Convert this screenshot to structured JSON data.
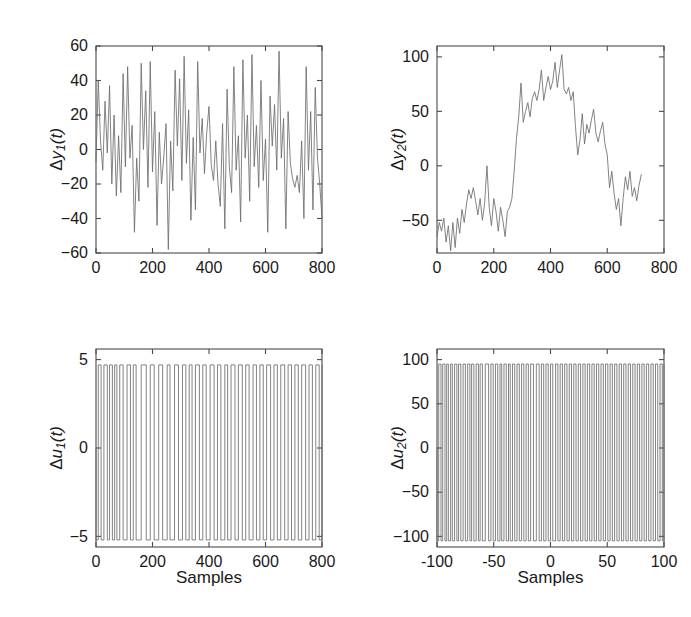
{
  "figure": {
    "background": "#ffffff",
    "trace_color": "#6d6d6d",
    "axis_color": "#4a4a4a",
    "xlabel": "Samples"
  },
  "chart_data": [
    {
      "id": "dy1",
      "type": "line",
      "title": "",
      "xlabel": "",
      "ylabel": "Δy_1(t)",
      "ylabel_parts": {
        "delta": "Δ",
        "var": "y",
        "sub": "1",
        "suffix": "(t)"
      },
      "xlim": [
        0,
        800
      ],
      "ylim": [
        -60,
        60
      ],
      "xticks": [
        0,
        200,
        400,
        600,
        800
      ],
      "yticks": [
        -60,
        -40,
        -20,
        0,
        20,
        40,
        60
      ],
      "xticklabels": [
        "0",
        "200",
        "400",
        "600",
        "800"
      ],
      "yticklabels": [
        "-60",
        "-40",
        "-20",
        "0",
        "20",
        "40",
        "60"
      ],
      "grid": false,
      "legend": null,
      "x": [
        0,
        8,
        16,
        24,
        32,
        40,
        48,
        56,
        64,
        72,
        80,
        88,
        96,
        104,
        112,
        120,
        128,
        136,
        144,
        152,
        160,
        168,
        176,
        184,
        192,
        200,
        208,
        216,
        224,
        232,
        240,
        248,
        256,
        264,
        272,
        280,
        288,
        296,
        304,
        312,
        320,
        328,
        336,
        344,
        352,
        360,
        368,
        376,
        384,
        392,
        400,
        408,
        416,
        424,
        432,
        440,
        448,
        456,
        464,
        472,
        480,
        488,
        496,
        504,
        512,
        520,
        528,
        536,
        544,
        552,
        560,
        568,
        576,
        584,
        592,
        600,
        608,
        616,
        624,
        632,
        640,
        648,
        656,
        664,
        672,
        680,
        688,
        696,
        704,
        712,
        720,
        728,
        736,
        744,
        752,
        760,
        768,
        776,
        784,
        792,
        800
      ],
      "values": [
        -7,
        40,
        5,
        -12,
        28,
        -2,
        37,
        -20,
        20,
        -27,
        8,
        -25,
        44,
        -10,
        48,
        -5,
        14,
        -48,
        -5,
        -30,
        50,
        0,
        34,
        -22,
        51,
        -13,
        22,
        -44,
        10,
        -20,
        -4,
        15,
        -58,
        5,
        -24,
        46,
        2,
        41,
        -18,
        54,
        -8,
        23,
        -41,
        7,
        -35,
        51,
        -2,
        18,
        -14,
        10,
        25,
        -9,
        -18,
        5,
        -20,
        -33,
        15,
        -46,
        35,
        -10,
        -25,
        48,
        -12,
        8,
        -42,
        52,
        -5,
        20,
        -30,
        55,
        -10,
        14,
        -22,
        40,
        -18,
        6,
        -48,
        31,
        2,
        26,
        -12,
        57,
        -5,
        18,
        -46,
        22,
        -8,
        -17,
        -22,
        -15,
        -25,
        5,
        -40,
        48,
        -12,
        22,
        -35,
        36,
        -5,
        -20,
        -40,
        -15
      ]
    },
    {
      "id": "dy2",
      "type": "line",
      "title": "",
      "xlabel": "",
      "ylabel": "Δy_2(t)",
      "ylabel_parts": {
        "delta": "Δ",
        "var": "y",
        "sub": "2",
        "suffix": "(t)"
      },
      "xlim": [
        0,
        800
      ],
      "ylim": [
        -80,
        110
      ],
      "xticks": [
        0,
        200,
        400,
        600,
        800
      ],
      "yticks": [
        -50,
        0,
        50,
        100
      ],
      "xticklabels": [
        "0",
        "200",
        "400",
        "600",
        "800"
      ],
      "yticklabels": [
        "-50",
        "0",
        "50",
        "100"
      ],
      "grid": false,
      "legend": null,
      "x": [
        0,
        8,
        16,
        24,
        32,
        40,
        48,
        56,
        64,
        72,
        80,
        88,
        96,
        104,
        112,
        120,
        128,
        136,
        144,
        152,
        160,
        168,
        176,
        184,
        192,
        200,
        208,
        216,
        224,
        232,
        240,
        248,
        256,
        264,
        272,
        280,
        288,
        296,
        304,
        312,
        320,
        328,
        336,
        344,
        352,
        360,
        368,
        376,
        384,
        392,
        400,
        408,
        416,
        424,
        432,
        440,
        448,
        456,
        464,
        472,
        480,
        488,
        496,
        504,
        512,
        520,
        528,
        536,
        544,
        552,
        560,
        568,
        576,
        584,
        592,
        600,
        608,
        616,
        624,
        632,
        640,
        648,
        656,
        664,
        672,
        680,
        688,
        696,
        704,
        712,
        720,
        728,
        736,
        744,
        752,
        760,
        768,
        776,
        784,
        792,
        800
      ],
      "values": [
        -65,
        -52,
        -60,
        -48,
        -70,
        -55,
        -78,
        -52,
        -75,
        -48,
        -62,
        -40,
        -52,
        -35,
        -22,
        -30,
        -20,
        -32,
        -45,
        -30,
        -50,
        -34,
        0,
        -38,
        -55,
        -30,
        -42,
        -60,
        -38,
        -50,
        -65,
        -42,
        -38,
        -30,
        -5,
        25,
        45,
        76,
        40,
        50,
        58,
        45,
        62,
        68,
        60,
        70,
        88,
        60,
        72,
        82,
        70,
        78,
        95,
        72,
        88,
        102,
        70,
        66,
        72,
        60,
        68,
        36,
        10,
        24,
        48,
        20,
        38,
        30,
        42,
        52,
        30,
        22,
        32,
        40,
        20,
        10,
        -20,
        -5,
        -25,
        -40,
        -30,
        -55,
        -30,
        -10,
        -22,
        -5,
        -28,
        -20,
        -32,
        -18,
        -8
      ]
    },
    {
      "id": "du1",
      "type": "line",
      "title": "",
      "xlabel": "Samples",
      "ylabel": "Δu_1(t)",
      "ylabel_parts": {
        "delta": "Δ",
        "var": "u",
        "sub": "1",
        "suffix": "(t)"
      },
      "xlim": [
        0,
        800
      ],
      "ylim": [
        -5.6,
        5.6
      ],
      "xticks": [
        0,
        200,
        400,
        600,
        800
      ],
      "yticks": [
        -5,
        0,
        5
      ],
      "xticklabels": [
        "0",
        "200",
        "400",
        "600",
        "800"
      ],
      "yticklabels": [
        "-5",
        "0",
        "5"
      ],
      "grid": false,
      "legend": null,
      "signal_type": "prbs",
      "levels": [
        -5.2,
        4.7
      ],
      "edges": [
        0,
        8,
        18,
        28,
        40,
        48,
        58,
        66,
        74,
        84,
        96,
        110,
        122,
        132,
        142,
        160,
        178,
        192,
        206,
        222,
        236,
        252,
        262,
        278,
        292,
        306,
        318,
        330,
        340,
        352,
        366,
        378,
        390,
        404,
        418,
        430,
        442,
        456,
        466,
        478,
        492,
        504,
        518,
        530,
        542,
        556,
        568,
        580,
        592,
        604,
        618,
        630,
        642,
        654,
        668,
        680,
        692,
        704,
        716,
        728,
        742,
        754,
        766,
        778,
        790,
        800
      ],
      "start_level": 0
    },
    {
      "id": "du2",
      "type": "line",
      "title": "",
      "xlabel": "Samples",
      "ylabel": "Δu_2(t)",
      "ylabel_parts": {
        "delta": "Δ",
        "var": "u",
        "sub": "2",
        "suffix": "(t)"
      },
      "xlim": [
        0,
        800
      ],
      "ylim": [
        -112,
        112
      ],
      "xticks": [
        0,
        200,
        400,
        600,
        800
      ],
      "yticks": [
        -100,
        -50,
        0,
        50,
        100
      ],
      "xticklabels": [
        "-100",
        "-50",
        "0",
        "50",
        "100"
      ],
      "yticklabels": [
        "-100",
        "-50",
        "0",
        "50",
        "100"
      ],
      "grid": false,
      "legend": null,
      "signal_type": "prbs",
      "levels": [
        -105,
        95
      ],
      "edges": [
        0,
        6,
        14,
        20,
        28,
        34,
        40,
        48,
        54,
        62,
        70,
        76,
        84,
        92,
        100,
        108,
        116,
        122,
        130,
        138,
        146,
        152,
        160,
        170,
        182,
        190,
        198,
        206,
        214,
        222,
        228,
        236,
        244,
        252,
        258,
        266,
        274,
        282,
        290,
        298,
        306,
        314,
        322,
        330,
        340,
        350,
        360,
        368,
        376,
        384,
        392,
        400,
        408,
        418,
        426,
        434,
        442,
        450,
        458,
        466,
        474,
        482,
        490,
        498,
        506,
        514,
        522,
        530,
        538,
        546,
        554,
        562,
        570,
        578,
        586,
        594,
        602,
        610,
        618,
        626,
        634,
        642,
        650,
        658,
        666,
        674,
        682,
        690,
        698,
        706,
        714,
        722,
        730,
        738,
        746,
        754,
        762,
        770,
        778,
        786,
        794,
        800
      ],
      "start_level": 0
    }
  ],
  "panels": [
    {
      "id": "dy1",
      "position": {
        "left": 96,
        "top": 46,
        "width": 226,
        "height": 207
      }
    },
    {
      "id": "dy2",
      "position": {
        "left": 437,
        "top": 46,
        "width": 227,
        "height": 207
      }
    },
    {
      "id": "du1",
      "position": {
        "left": 96,
        "top": 349,
        "width": 226,
        "height": 198
      }
    },
    {
      "id": "du2",
      "position": {
        "left": 437,
        "top": 349,
        "width": 227,
        "height": 198
      }
    }
  ]
}
